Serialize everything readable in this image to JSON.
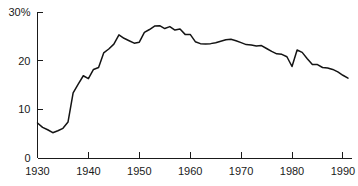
{
  "chart_data": {
    "type": "line",
    "title": "",
    "xlabel": "",
    "ylabel": "",
    "xlim": [
      1930,
      1991
    ],
    "ylim": [
      0,
      30
    ],
    "grid": false,
    "legend": null,
    "y_axis_unit_label": "30%",
    "yticks": [
      0,
      10,
      20,
      30
    ],
    "ytick_labels": [
      "0",
      "10",
      "20",
      "30%"
    ],
    "xticks": [
      1930,
      1940,
      1950,
      1960,
      1970,
      1980,
      1990
    ],
    "xtick_labels": [
      "1930",
      "1940",
      "1950",
      "1960",
      "1970",
      "1980",
      "1990"
    ],
    "line_color": "#141414",
    "axis_color": "#1a1a1a",
    "background_color": "#ffffff",
    "x": [
      1930,
      1931,
      1932,
      1933,
      1934,
      1935,
      1936,
      1937,
      1938,
      1939,
      1940,
      1941,
      1942,
      1943,
      1944,
      1945,
      1946,
      1947,
      1948,
      1949,
      1950,
      1951,
      1952,
      1953,
      1954,
      1955,
      1956,
      1957,
      1958,
      1959,
      1960,
      1961,
      1962,
      1963,
      1964,
      1965,
      1966,
      1967,
      1968,
      1969,
      1970,
      1971,
      1972,
      1973,
      1974,
      1975,
      1976,
      1977,
      1978,
      1979,
      1980,
      1981,
      1982,
      1983,
      1984,
      1985,
      1986,
      1987,
      1988,
      1989,
      1990,
      1991
    ],
    "y": [
      7.2,
      6.3,
      5.8,
      5.2,
      5.6,
      6.1,
      7.4,
      13.4,
      15.2,
      16.9,
      16.3,
      18.2,
      18.6,
      21.6,
      22.4,
      23.4,
      25.3,
      24.6,
      24.1,
      23.6,
      23.8,
      25.8,
      26.4,
      27.1,
      27.2,
      26.6,
      27.0,
      26.3,
      26.5,
      25.4,
      25.4,
      23.9,
      23.5,
      23.4,
      23.5,
      23.7,
      24.0,
      24.3,
      24.4,
      24.1,
      23.7,
      23.3,
      23.2,
      23.0,
      23.1,
      22.5,
      21.9,
      21.4,
      21.3,
      20.8,
      18.8,
      22.2,
      21.7,
      20.4,
      19.2,
      19.2,
      18.6,
      18.5,
      18.2,
      17.7,
      17.0,
      16.4
    ]
  }
}
